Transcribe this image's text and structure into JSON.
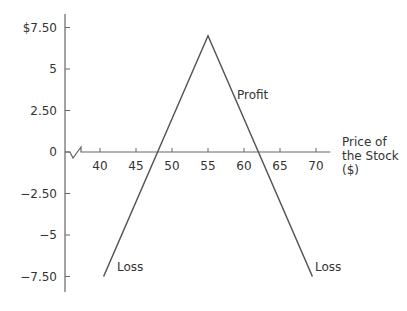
{
  "chart_data": {
    "type": "line",
    "title": "",
    "xlabel": "Price of the Stock ($)",
    "xlabel_lines": [
      "Price of",
      "the Stock",
      "($)"
    ],
    "ylabel": "",
    "xlim": [
      35,
      72
    ],
    "ylim": [
      -8.5,
      8.5
    ],
    "x_ticks": [
      40,
      45,
      50,
      55,
      60,
      65,
      70
    ],
    "x_tick_labels": [
      "40",
      "45",
      "50",
      "55",
      "60",
      "65",
      "70"
    ],
    "y_ticks": [
      7.5,
      5,
      2.5,
      0,
      -2.5,
      -5,
      -7.5
    ],
    "y_tick_labels": [
      "$7.50",
      "5",
      "2.50",
      "0",
      "−2.50",
      "−5",
      "−7.50"
    ],
    "axis_break": "x-axis break symbol near origin",
    "grid": false,
    "series": [
      {
        "name": "Payoff",
        "color": "#555555",
        "x": [
          40.5,
          55,
          69.5
        ],
        "y": [
          -7.5,
          7,
          -7.5
        ]
      }
    ],
    "zero_crossings": [
      48,
      62
    ],
    "annotations": [
      {
        "text": "Profit",
        "x": 58,
        "y": 3.5
      },
      {
        "text": "Loss",
        "x": 42,
        "y": -7.3
      },
      {
        "text": "Loss",
        "x": 70,
        "y": -7.3
      }
    ]
  },
  "colors": {
    "axis": "#666666",
    "line": "#555555",
    "text": "#333333"
  }
}
